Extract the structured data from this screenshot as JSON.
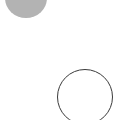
{
  "canvas": {
    "width": 124,
    "height": 120,
    "background": "#ffffff"
  },
  "shapes": [
    {
      "type": "circle",
      "style": "filled",
      "fill": "#b3b3b3",
      "center": [
        26,
        -2
      ],
      "radius": 20
    },
    {
      "type": "circle",
      "style": "outline",
      "stroke": "#3a3a3a",
      "center": [
        85,
        97
      ],
      "radius": 28
    }
  ]
}
